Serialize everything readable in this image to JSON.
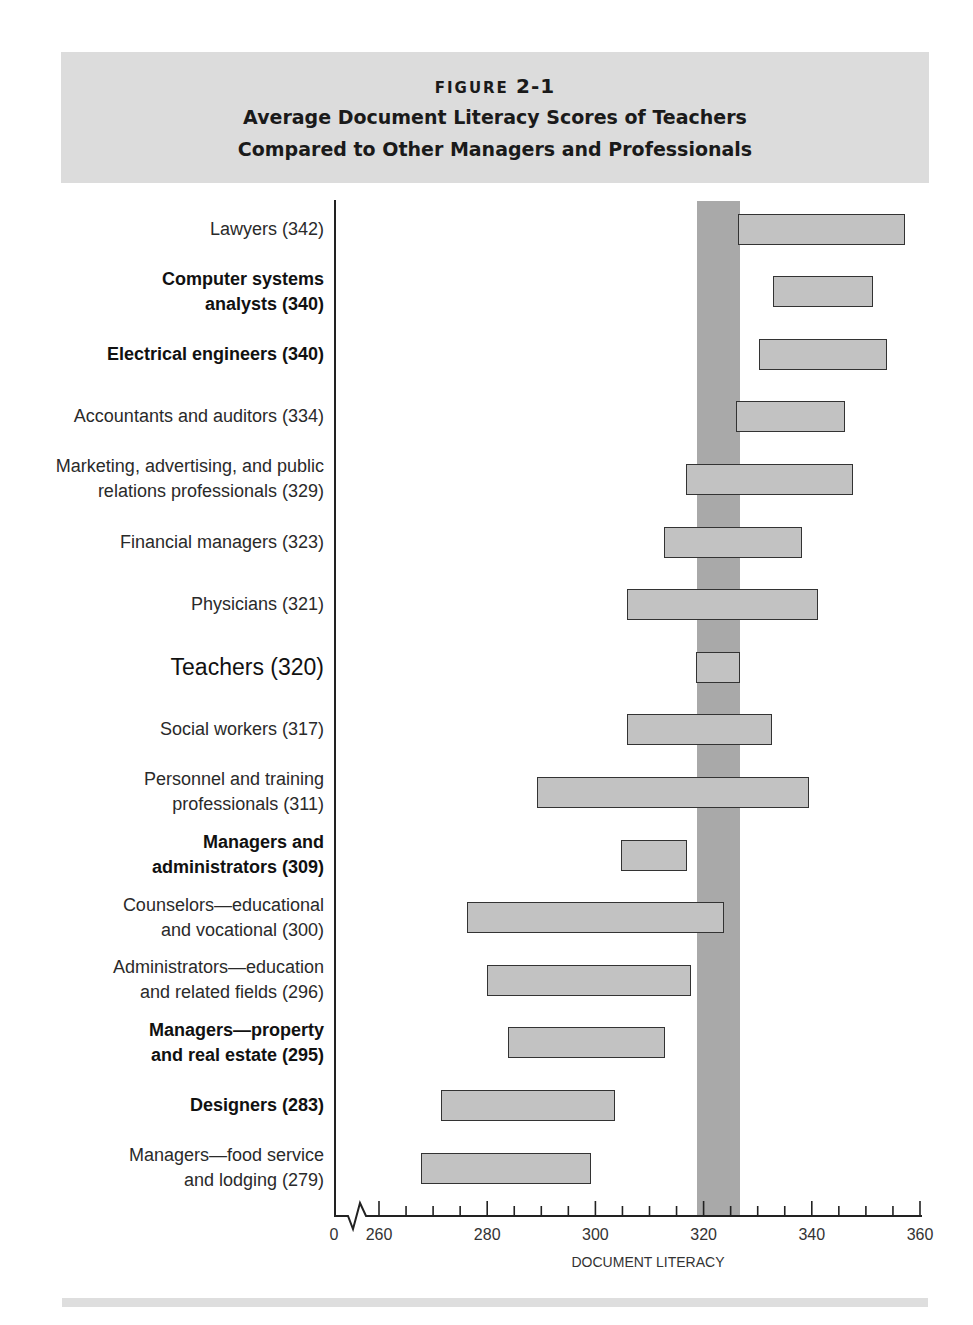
{
  "header": {
    "figure_word": "FIGURE",
    "figure_number": "2-1",
    "title_line1": "Average Document Literacy Scores of Teachers",
    "title_line2": "Compared to Other Managers and Professionals"
  },
  "colors": {
    "header_bg": "#dcdcdc",
    "bar_fill": "#c2c2c2",
    "bar_border": "#333333",
    "teacher_band": "#a9a9a9"
  },
  "chart_data": {
    "type": "bar",
    "orientation": "horizontal-range",
    "title": "Average Document Literacy Scores of Teachers Compared to Other Managers and Professionals",
    "xlabel": "DOCUMENT LITERACY",
    "ylabel": "",
    "xlim": [
      0,
      360
    ],
    "axis_break": "between 0 and 260",
    "x_ticks": [
      "0",
      "260",
      "280",
      "300",
      "320",
      "340",
      "360"
    ],
    "minor_tick_step": 5,
    "grid": false,
    "legend": null,
    "reference_band": {
      "label": "Teachers range",
      "from": 318.6,
      "to": 326.7
    },
    "categories": [
      "Lawyers (342)",
      "Computer systems analysts (340)",
      "Electrical engineers (340)",
      "Accountants and auditors (334)",
      "Marketing, advertising, and public relations professionals (329)",
      "Financial managers (323)",
      "Physicians (321)",
      "Teachers (320)",
      "Social workers (317)",
      "Personnel and training professionals (311)",
      "Managers and administrators (309)",
      "Counselors—educational and vocational (300)",
      "Administrators—education and related fields (296)",
      "Managers—property and real estate (295)",
      "Designers (283)",
      "Managers—food service and lodging (279)"
    ],
    "average_scores": [
      342,
      340,
      340,
      334,
      329,
      323,
      321,
      320,
      317,
      311,
      309,
      300,
      296,
      295,
      283,
      279
    ],
    "series": [
      {
        "name": "range_low",
        "values": [
          326.4,
          332.8,
          330.2,
          326.0,
          316.7,
          312.7,
          305.8,
          318.6,
          305.8,
          289.2,
          304.7,
          276.3,
          280.0,
          283.8,
          271.5,
          267.8
        ]
      },
      {
        "name": "range_high",
        "values": [
          357.2,
          351.3,
          353.9,
          346.1,
          347.6,
          338.2,
          341.1,
          326.7,
          332.6,
          339.5,
          316.9,
          323.8,
          317.7,
          312.8,
          303.6,
          299.2
        ]
      }
    ]
  },
  "rows": [
    {
      "line1": "Lawyers (342)",
      "line2": "",
      "style": "normal"
    },
    {
      "line1": "Computer systems",
      "line2": "analysts (340)",
      "style": "bold"
    },
    {
      "line1": "Electrical engineers (340)",
      "line2": "",
      "style": "bold"
    },
    {
      "line1": "Accountants and auditors (334)",
      "line2": "",
      "style": "normal"
    },
    {
      "line1": "Marketing, advertising, and public",
      "line2": "relations professionals (329)",
      "style": "normal"
    },
    {
      "line1": "Financial managers (323)",
      "line2": "",
      "style": "normal"
    },
    {
      "line1": "Physicians (321)",
      "line2": "",
      "style": "normal"
    },
    {
      "line1": "Teachers (320)",
      "line2": "",
      "style": "big"
    },
    {
      "line1": "Social workers (317)",
      "line2": "",
      "style": "normal"
    },
    {
      "line1": "Personnel and training",
      "line2": "professionals (311)",
      "style": "normal"
    },
    {
      "line1": "Managers and",
      "line2": "administrators (309)",
      "style": "bold"
    },
    {
      "line1": "Counselors—educational",
      "line2": "and vocational (300)",
      "style": "normal"
    },
    {
      "line1": "Administrators—education",
      "line2": "and related fields (296)",
      "style": "normal"
    },
    {
      "line1": "Managers—property",
      "line2": "and real estate (295)",
      "style": "bold"
    },
    {
      "line1": "Designers (283)",
      "line2": "",
      "style": "bold"
    },
    {
      "line1": "Managers—food service",
      "line2": "and lodging (279)",
      "style": "normal"
    }
  ],
  "axis": {
    "ticks": [
      "0",
      "260",
      "280",
      "300",
      "320",
      "340",
      "360"
    ],
    "label": "DOCUMENT LITERACY"
  }
}
